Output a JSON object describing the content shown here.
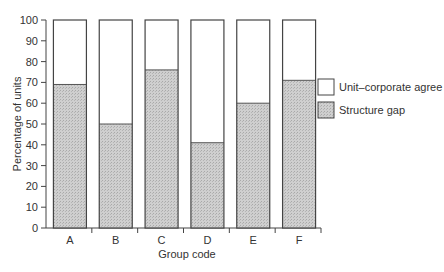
{
  "chart_data": {
    "type": "bar",
    "stacked": true,
    "title": "",
    "xlabel": "Group code",
    "ylabel": "Percentage of units",
    "ylim": [
      0,
      100
    ],
    "yticks": [
      0,
      10,
      20,
      30,
      40,
      50,
      60,
      70,
      80,
      90,
      100
    ],
    "categories": [
      "A",
      "B",
      "C",
      "D",
      "E",
      "F"
    ],
    "series": [
      {
        "name": "Structure gap",
        "values": [
          69,
          50,
          76,
          41,
          60,
          71
        ],
        "color": "#c8c8c8"
      },
      {
        "name": "Unit–corporate agree",
        "values": [
          31,
          50,
          24,
          59,
          40,
          29
        ],
        "color": "#ffffff"
      }
    ],
    "legend": {
      "position": "right",
      "entries": [
        "Unit–corporate agree",
        "Structure gap"
      ]
    },
    "grid": false
  }
}
